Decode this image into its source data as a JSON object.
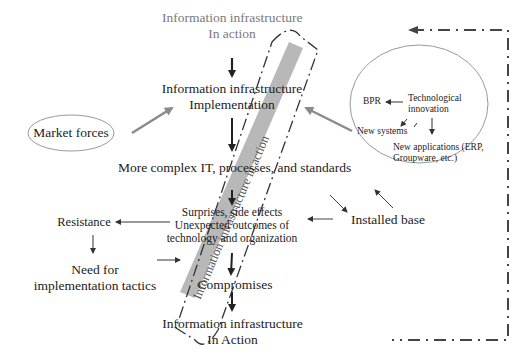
{
  "diagram": {
    "top_node": {
      "line1": "Information infrastructure",
      "line2": "In action"
    },
    "implementation_node": {
      "line1": "Information infrastructure",
      "line2": "Implementation"
    },
    "market_forces": "Market forces",
    "complexity_node": "More complex IT, processes, and standards",
    "surprises_node": {
      "line1": "Surprises, side effects",
      "line2": "Unexpected outcomes of",
      "line3": "technology and organization"
    },
    "resistance": "Resistance",
    "tactics_node": {
      "line1": "Need for",
      "line2": "implementation tactics"
    },
    "installed_base": "Installed base",
    "compromises": "Compromises",
    "bottom_node": {
      "line1": "Information infrastructure",
      "line2": "In Action"
    },
    "diagonal_band_label": "Information infrastructure in action",
    "innovation_circle": {
      "technological_innovation": {
        "line1": "Technological",
        "line2": "innovation"
      },
      "bpr": "BPR",
      "new_systems": "New systems",
      "new_applications": {
        "line1": "New applications (ERP,",
        "line2": "Groupware, etc.)"
      }
    },
    "colors": {
      "text": "#222222",
      "gray_text": "#7a7a7a",
      "band_fill": "#b0b0b0",
      "gray_arrow": "#8a8a8a",
      "dashed_loop": "#444444"
    }
  }
}
